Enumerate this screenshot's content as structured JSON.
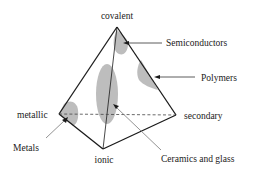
{
  "diagram": {
    "type": "bonding-tetrahedron",
    "vertices": {
      "covalent": "covalent",
      "metallic": "metallic",
      "secondary": "secondary",
      "ionic": "ionic"
    },
    "material_classes": {
      "semiconductors": "Semiconductors",
      "polymers": "Polymers",
      "metals": "Metals",
      "ceramics": "Ceramics and glass"
    },
    "colors": {
      "edge": "#1a1a1a",
      "region": "#b8b8b8",
      "pointer": "#555555",
      "text": "#1a1a1a"
    }
  }
}
